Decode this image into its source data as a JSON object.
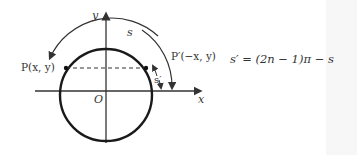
{
  "diagram": {
    "axes": {
      "x_label": "x",
      "y_label": "y",
      "origin_label": "O"
    },
    "points": [
      {
        "id": "P",
        "label": "P(x, y)"
      },
      {
        "id": "P_prime",
        "label": "P′(−x, y)"
      }
    ],
    "arcs": [
      {
        "id": "s",
        "label": "s"
      },
      {
        "id": "s_prime",
        "label": "s′"
      }
    ],
    "equation": "s′ = (2n − 1)π − s",
    "colors": {
      "stroke": "#222222",
      "text": "#333333",
      "background": "#ffffff"
    }
  }
}
